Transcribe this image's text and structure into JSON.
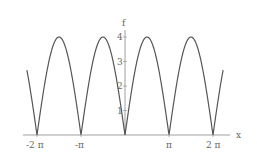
{
  "chart_data": {
    "type": "line",
    "title": "",
    "xlabel": "x",
    "ylabel": "f",
    "function": "4|sin(x)|",
    "xlim": [
      -2.23,
      2.23
    ],
    "xlim_units": "pi",
    "ylim": [
      0,
      4.2
    ],
    "x_ticks": [
      "-2 π",
      "-π",
      "π",
      "2 π"
    ],
    "y_ticks": [
      "1",
      "2",
      "3",
      "4"
    ],
    "grid": false,
    "series": [
      {
        "name": "f",
        "x": [
          -7.0,
          -6.283,
          -5.498,
          -4.712,
          -3.927,
          -3.142,
          -2.356,
          -1.571,
          -0.785,
          0,
          0.785,
          1.571,
          2.356,
          3.142,
          3.927,
          4.712,
          5.498,
          6.283,
          7.0
        ],
        "values": [
          2.63,
          0,
          2.83,
          4,
          2.83,
          0,
          2.83,
          4,
          2.83,
          0,
          2.83,
          4,
          2.83,
          0,
          2.83,
          4,
          2.83,
          0,
          2.63
        ]
      }
    ]
  },
  "labels": {
    "x_axis": "x",
    "y_axis": "f",
    "xt": [
      "-2 π",
      "-π",
      "π",
      "2 π"
    ],
    "yt": [
      "1",
      "2",
      "3",
      "4"
    ]
  }
}
